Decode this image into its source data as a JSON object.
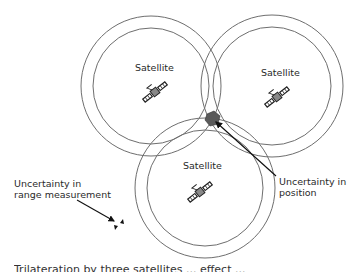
{
  "figure": {
    "type": "trilateration-diagram",
    "satellites": [
      {
        "label": "Satellite",
        "cx": 151,
        "cy": 86,
        "r_outer": 70,
        "r_inner": 58,
        "label_x": 135,
        "label_y": 62,
        "icon_x": 155,
        "icon_y": 92
      },
      {
        "label": "Satellite",
        "cx": 272,
        "cy": 86,
        "r_outer": 71,
        "r_inner": 59,
        "label_x": 261,
        "label_y": 67,
        "icon_x": 277,
        "icon_y": 97
      },
      {
        "label": "Satellite",
        "cx": 205,
        "cy": 188,
        "r_outer": 70,
        "r_inner": 58,
        "label_x": 183,
        "label_y": 160,
        "icon_x": 200,
        "icon_y": 190
      }
    ],
    "annotations": {
      "range_uncertainty": {
        "line1": "Uncertainty in",
        "line2": "range measurement"
      },
      "position_uncertainty": {
        "line1": "Uncertainty in",
        "line2": "position"
      }
    },
    "position_marker_color": "#555555",
    "stroke_color": "#6e6e6e",
    "caption": "Trilateration by three satellites ... effect ..."
  }
}
